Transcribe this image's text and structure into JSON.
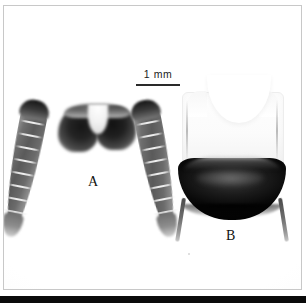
{
  "figure": {
    "kind": "microscopy-figure-plate",
    "width_px": 306,
    "height_px": 303,
    "background_color": "#ffffff",
    "frame_color": "#c8c8c8",
    "bottom_bar_color": "#0a0a0a"
  },
  "scale_bar": {
    "label": "1 mm",
    "length_px": 44,
    "line_color": "#2a2a2a",
    "text_color": "#1b1b1b"
  },
  "panels": [
    {
      "letter": "A",
      "name": "specimen-a",
      "description": "Paired elongate segmented appendages (cerci) attached to a dark sclerotised basal body with a median pale notch",
      "appendage_count": 2,
      "segments_per_appendage": 9,
      "tone": "mid-grey to dark-grey",
      "colors": {
        "dark": "#161616",
        "mid": "#6e6e6e",
        "light": "#c9c9c9"
      }
    },
    {
      "letter": "B",
      "name": "specimen-b",
      "description": "Terminal abdominal segment, pale translucent upper tergite with deep median concavity above a strongly sclerotised black subgenital plate bearing two slender styli",
      "stylus_count": 2,
      "tone": "pale white above, near-black below",
      "colors": {
        "pale": "#fefefe",
        "dark": "#090909",
        "stylus": "#6c6c6c"
      }
    }
  ],
  "labels": {
    "panel_a": "A",
    "panel_b": "B"
  }
}
